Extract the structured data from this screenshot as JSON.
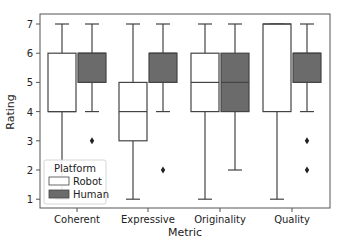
{
  "chart_data": {
    "type": "boxplot",
    "title": "",
    "xlabel": "Metric",
    "ylabel": "Rating",
    "ylim": [
      0.7,
      7.3
    ],
    "yticks": [
      1,
      2,
      3,
      4,
      5,
      6,
      7
    ],
    "grid": false,
    "categories": [
      "Coherent",
      "Expressive",
      "Originality",
      "Quality"
    ],
    "legend": {
      "title": "Platform",
      "position": "lower left",
      "entries": [
        {
          "label": "Robot",
          "color": "#ffffff"
        },
        {
          "label": "Human",
          "color": "#6b6b6b"
        }
      ]
    },
    "series": [
      {
        "name": "Robot",
        "color": "#ffffff",
        "boxes": [
          {
            "category": "Coherent",
            "whislo": 1,
            "q1": 4,
            "med": 4,
            "q3": 6,
            "whishi": 7,
            "fliers": []
          },
          {
            "category": "Expressive",
            "whislo": 1,
            "q1": 3,
            "med": 4,
            "q3": 5,
            "whishi": 7,
            "fliers": []
          },
          {
            "category": "Originality",
            "whislo": 1,
            "q1": 4,
            "med": 5,
            "q3": 6,
            "whishi": 7,
            "fliers": []
          },
          {
            "category": "Quality",
            "whislo": 1,
            "q1": 4,
            "med": 7,
            "q3": 7,
            "whishi": 7,
            "fliers": []
          }
        ]
      },
      {
        "name": "Human",
        "color": "#6b6b6b",
        "boxes": [
          {
            "category": "Coherent",
            "whislo": 4,
            "q1": 5,
            "med": 6,
            "q3": 6,
            "whishi": 7,
            "fliers": [
              3
            ]
          },
          {
            "category": "Expressive",
            "whislo": 4,
            "q1": 5,
            "med": 6,
            "q3": 6,
            "whishi": 7,
            "fliers": [
              2
            ]
          },
          {
            "category": "Originality",
            "whislo": 2,
            "q1": 4,
            "med": 5,
            "q3": 6,
            "whishi": 7,
            "fliers": []
          },
          {
            "category": "Quality",
            "whislo": 4,
            "q1": 5,
            "med": 6,
            "q3": 6,
            "whishi": 7,
            "fliers": [
              3,
              2
            ]
          }
        ]
      }
    ]
  }
}
